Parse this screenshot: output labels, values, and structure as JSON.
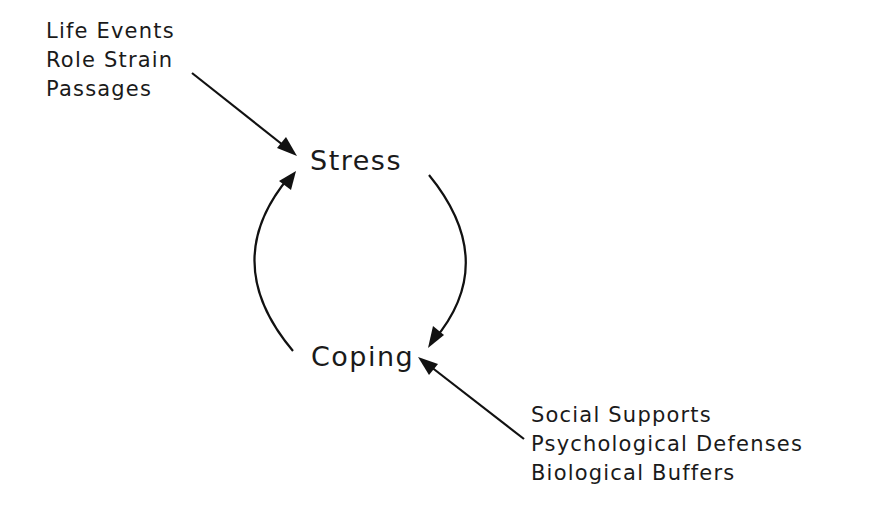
{
  "diagram": {
    "nodes": {
      "stress": "Stress",
      "coping": "Coping"
    },
    "stressors": {
      "items": [
        "Life Events",
        "Role Strain",
        "Passages"
      ]
    },
    "coping_resources": {
      "items": [
        "Social Supports",
        "Psychological Defenses",
        "Biological Buffers"
      ]
    },
    "edges": [
      {
        "from": "stressors",
        "to": "stress"
      },
      {
        "from": "stress",
        "to": "coping"
      },
      {
        "from": "coping",
        "to": "stress"
      },
      {
        "from": "coping_resources",
        "to": "coping"
      }
    ],
    "colors": {
      "ink": "#111111",
      "background": "#ffffff"
    }
  }
}
